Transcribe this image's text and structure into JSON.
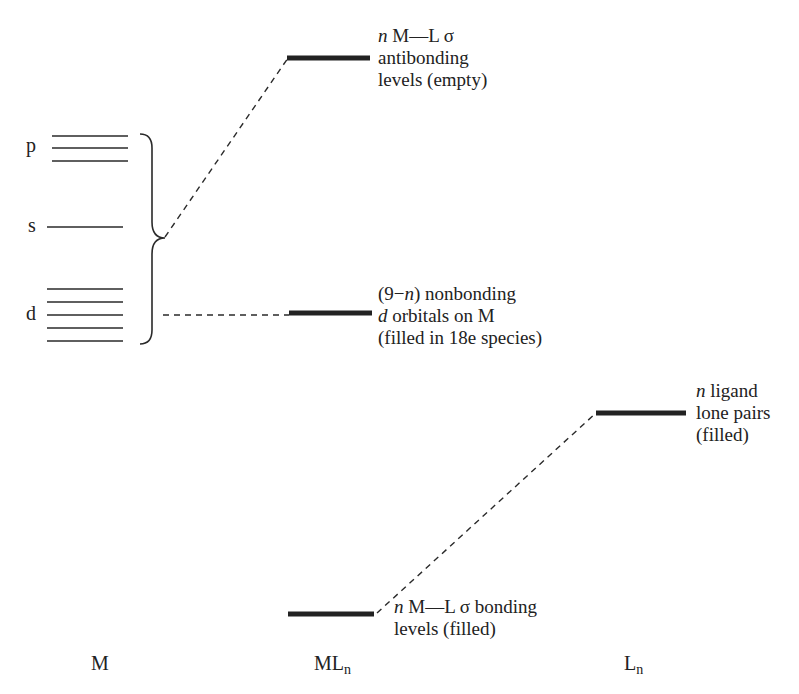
{
  "metal": {
    "p_label": "p",
    "s_label": "s",
    "d_label": "d"
  },
  "labels": {
    "antibonding": {
      "line1_n": "n",
      "line1_rest": " M—L σ",
      "line2": "antibonding",
      "line3": "levels (empty)"
    },
    "nonbonding": {
      "line1_pre": "(9−",
      "line1_n": "n",
      "line1_post": ") nonbonding",
      "line2_d": "d",
      "line2_rest": " orbitals on M",
      "line3": "(filled in 18e species)"
    },
    "ligand": {
      "line1_n": "n",
      "line1_rest": " ligand",
      "line2": "lone pairs",
      "line3": "(filled)"
    },
    "bonding": {
      "line1_n": "n",
      "line1_rest": " M—L σ bonding",
      "line2": "levels (filled)"
    }
  },
  "columns": {
    "metal": "M",
    "complex_main": "ML",
    "complex_sub": "n",
    "ligand_main": "L",
    "ligand_sub": "n"
  },
  "colors": {
    "line": "#1a1a1a",
    "thick_level": "#222222"
  }
}
